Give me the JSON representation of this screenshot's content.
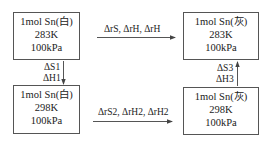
{
  "diagram": {
    "type": "thermodynamic-cycle",
    "boxes": {
      "top_left": {
        "substance": "1mol  Sn(白)",
        "temperature": "283K",
        "pressure": "100kPa"
      },
      "top_right": {
        "substance": "1mol  Sn(灰)",
        "temperature": "283K",
        "pressure": "100kPa"
      },
      "bottom_left": {
        "substance": "1mol  Sn(白)",
        "temperature": "298K",
        "pressure": "100kPa"
      },
      "bottom_right": {
        "substance": "1mol  Sn(灰)",
        "temperature": "298K",
        "pressure": "100kPa"
      }
    },
    "arrows": {
      "top": {
        "direction": "right",
        "label": "ΔrS, ΔrH, ΔrH"
      },
      "bottom": {
        "direction": "right",
        "label": "ΔrS2, ΔrH2, ΔrH2"
      },
      "left": {
        "direction": "down",
        "label_1": "ΔS1",
        "label_2": "ΔH1"
      },
      "right": {
        "direction": "up",
        "label_1": "ΔS3",
        "label_2": "ΔH3"
      }
    },
    "colors": {
      "line": "#555555",
      "text": "#222222",
      "background": "#ffffff"
    }
  }
}
